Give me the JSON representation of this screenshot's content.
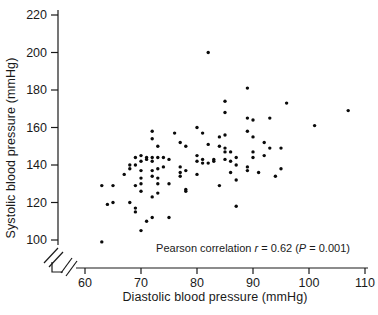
{
  "figure": {
    "background": "#ffffff",
    "ink_color": "#1a1a1a"
  },
  "chart_data": {
    "type": "scatter",
    "title": "",
    "xlabel": "Diastolic blood pressure (mmHg)",
    "ylabel": "Systolic blood pressure (mmHg)",
    "xlim": [
      60,
      110
    ],
    "ylim": [
      100,
      220
    ],
    "x_ticks": [
      60,
      70,
      80,
      90,
      100,
      110
    ],
    "y_ticks": [
      100,
      120,
      140,
      160,
      180,
      200,
      220
    ],
    "grid": false,
    "axis_break": {
      "x_axis": true,
      "y_axis": true
    },
    "marker": {
      "shape": "dot",
      "color": "#0a0a0a",
      "radius_px": 1.7
    },
    "annotation": {
      "full_text": "Pearson correlation r = 0.62 (P = 0.001)",
      "prefix": "Pearson correlation ",
      "r_symbol": "r",
      "r_part": " = 0.62 (",
      "p_symbol": "P",
      "p_part": " = 0.001)",
      "pearson_r": 0.62,
      "p_value": 0.001
    },
    "points": [
      [
        82,
        200
      ],
      [
        89,
        181
      ],
      [
        85,
        174
      ],
      [
        96,
        173
      ],
      [
        107,
        169
      ],
      [
        85,
        168
      ],
      [
        89,
        165
      ],
      [
        93,
        165
      ],
      [
        90,
        164
      ],
      [
        101,
        161
      ],
      [
        80,
        160
      ],
      [
        72,
        158
      ],
      [
        89,
        158
      ],
      [
        76,
        157
      ],
      [
        81,
        157
      ],
      [
        85,
        156
      ],
      [
        84,
        155
      ],
      [
        90,
        155
      ],
      [
        72,
        154
      ],
      [
        92,
        152
      ],
      [
        77,
        152
      ],
      [
        82,
        151
      ],
      [
        73,
        150
      ],
      [
        78,
        150
      ],
      [
        84,
        150
      ],
      [
        85,
        149
      ],
      [
        93,
        149
      ],
      [
        95,
        149
      ],
      [
        80,
        145
      ],
      [
        70,
        145
      ],
      [
        87,
        144
      ],
      [
        69,
        144
      ],
      [
        71,
        144
      ],
      [
        72,
        144
      ],
      [
        73,
        144
      ],
      [
        74,
        144
      ],
      [
        90,
        144
      ],
      [
        75,
        143
      ],
      [
        71,
        143
      ],
      [
        81,
        143
      ],
      [
        83,
        143
      ],
      [
        85,
        143
      ],
      [
        70,
        142
      ],
      [
        72,
        142
      ],
      [
        80,
        142
      ],
      [
        81,
        141
      ],
      [
        82,
        141
      ],
      [
        86,
        142
      ],
      [
        83,
        142
      ],
      [
        90,
        147
      ],
      [
        85,
        147
      ],
      [
        86,
        147
      ],
      [
        92,
        145
      ],
      [
        87,
        140
      ],
      [
        68,
        140
      ],
      [
        69,
        140
      ],
      [
        89,
        139
      ],
      [
        74,
        139
      ],
      [
        77,
        139
      ],
      [
        68,
        138
      ],
      [
        73,
        138
      ],
      [
        95,
        138
      ],
      [
        78,
        137
      ],
      [
        70,
        137
      ],
      [
        72,
        137
      ],
      [
        89,
        137
      ],
      [
        77,
        136
      ],
      [
        91,
        136
      ],
      [
        86,
        136
      ],
      [
        67,
        135
      ],
      [
        80,
        135
      ],
      [
        77,
        134
      ],
      [
        94,
        134
      ],
      [
        72,
        134
      ],
      [
        70,
        133
      ],
      [
        73,
        133
      ],
      [
        87,
        132
      ],
      [
        63,
        129
      ],
      [
        65,
        129
      ],
      [
        69,
        129
      ],
      [
        84,
        129
      ],
      [
        75,
        130
      ],
      [
        70,
        130
      ],
      [
        73,
        130
      ],
      [
        78,
        127
      ],
      [
        70,
        126
      ],
      [
        78,
        126
      ],
      [
        73,
        125
      ],
      [
        72,
        123
      ],
      [
        65,
        120
      ],
      [
        68,
        120
      ],
      [
        64,
        119
      ],
      [
        87,
        118
      ],
      [
        69,
        117
      ],
      [
        69,
        115
      ],
      [
        72,
        112
      ],
      [
        75,
        112
      ],
      [
        71,
        110
      ],
      [
        70,
        105
      ],
      [
        63,
        99
      ]
    ]
  }
}
